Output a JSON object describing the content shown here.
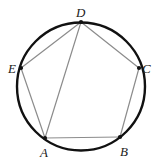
{
  "figure": {
    "kind": "cyclic-pentagon-diagram",
    "width": 162,
    "height": 166,
    "background_color": "#ffffff",
    "circle": {
      "name": "circumscribed-circle",
      "cx": 81,
      "cy": 86.5,
      "r": 64,
      "stroke_color": "#111111",
      "stroke_width": 2.4,
      "fill": "none"
    },
    "chord_style": {
      "stroke_color": "#8c8c8c",
      "stroke_width": 1.2
    },
    "vertex_style": {
      "dot_color": "#111111",
      "dot_radius": 2.1
    },
    "vertices": [
      {
        "id": "A",
        "label": "A",
        "x": 45,
        "y": 138,
        "label_x": 40,
        "label_y": 146
      },
      {
        "id": "B",
        "label": "B",
        "x": 120,
        "y": 137,
        "label_x": 120,
        "label_y": 145
      },
      {
        "id": "C",
        "label": "C",
        "x": 139,
        "y": 68,
        "label_x": 142,
        "label_y": 62
      },
      {
        "id": "D",
        "label": "D",
        "x": 81,
        "y": 22,
        "label_x": 76,
        "label_y": 6
      },
      {
        "id": "E",
        "label": "E",
        "x": 21,
        "y": 68,
        "label_x": 8,
        "label_y": 62
      }
    ],
    "chords": [
      {
        "name": "chord-A-B",
        "from": "A",
        "to": "B"
      },
      {
        "name": "chord-B-C",
        "from": "B",
        "to": "C"
      },
      {
        "name": "chord-C-D",
        "from": "C",
        "to": "D"
      },
      {
        "name": "chord-D-E",
        "from": "D",
        "to": "E"
      },
      {
        "name": "chord-E-A",
        "from": "E",
        "to": "A"
      },
      {
        "name": "chord-D-A",
        "from": "D",
        "to": "A"
      }
    ]
  }
}
